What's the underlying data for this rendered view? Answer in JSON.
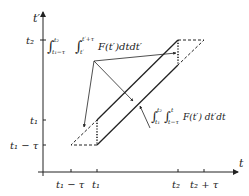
{
  "axes": {
    "x_label": "t",
    "y_label": "t′",
    "x_ticks": [
      "t1 − τ",
      "t1",
      "t2",
      "t2 + τ"
    ],
    "y_ticks": [
      "t2",
      "t1",
      "t1 − τ"
    ]
  },
  "labels": {
    "upper_integral": "∫ t1−τ..t2 ∫ t′..t′+τ F(t′)dtdt′",
    "upper_int_outer_sub": "t₁−τ",
    "upper_int_outer_sup": "t₂",
    "upper_int_inner_sub": "t′",
    "upper_int_inner_sup": "t′+τ",
    "upper_integrand": "F(t′)dtdt′",
    "lower_integral": "∫ t1..t2 ∫ t−τ..t F(t′)dt′dt",
    "lower_int_outer_sub": "t₁",
    "lower_int_outer_sup": "t₂",
    "lower_int_inner_sub": "t−τ",
    "lower_int_inner_sup": "t",
    "lower_integrand": "F(t′) dt′dt"
  },
  "tick_text": {
    "x_t1_minus_tau": "t₁ − τ",
    "x_t1": "t₁",
    "x_t2": "t₂",
    "x_t2_plus_tau": "t₂ + τ",
    "y_t2": "t₂",
    "y_t1": "t₁",
    "y_t1_minus_tau": "t₁ − τ",
    "x_axis": "t",
    "y_axis": "t′"
  },
  "integral_sign": "∫"
}
